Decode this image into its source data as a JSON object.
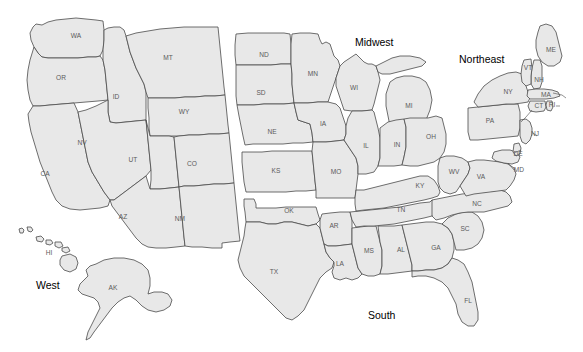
{
  "map": {
    "title": "United States Census Regions Map",
    "background_color": "#ffffff",
    "state_fill_color": "#e8e8e8",
    "state_border_color": "#4a4a4a",
    "state_label_color": "#5a5a5a",
    "region_label_color": "#000000"
  },
  "regions": [
    {
      "name": "West",
      "label": "West",
      "x": 36,
      "y": 280
    },
    {
      "name": "Midwest",
      "label": "Midwest",
      "x": 355,
      "y": 37
    },
    {
      "name": "South",
      "label": "South",
      "x": 368,
      "y": 310
    },
    {
      "name": "Northeast",
      "label": "Northeast",
      "x": 459,
      "y": 54
    }
  ],
  "states": [
    {
      "abbr": "WA",
      "name": "Washington",
      "region": "West",
      "lx": 76,
      "ly": 38
    },
    {
      "abbr": "OR",
      "name": "Oregon",
      "region": "West",
      "lx": 61,
      "ly": 80
    },
    {
      "abbr": "ID",
      "name": "Idaho",
      "region": "West",
      "lx": 116,
      "ly": 99
    },
    {
      "abbr": "MT",
      "name": "Montana",
      "region": "West",
      "lx": 168,
      "ly": 60
    },
    {
      "abbr": "WY",
      "name": "Wyoming",
      "region": "West",
      "lx": 184,
      "ly": 114
    },
    {
      "abbr": "NV",
      "name": "Nevada",
      "region": "West",
      "lx": 82,
      "ly": 145
    },
    {
      "abbr": "UT",
      "name": "Utah",
      "region": "West",
      "lx": 133,
      "ly": 162
    },
    {
      "abbr": "CO",
      "name": "Colorado",
      "region": "West",
      "lx": 192,
      "ly": 166
    },
    {
      "abbr": "CA",
      "name": "California",
      "region": "West",
      "lx": 45,
      "ly": 176
    },
    {
      "abbr": "AZ",
      "name": "Arizona",
      "region": "West",
      "lx": 123,
      "ly": 219
    },
    {
      "abbr": "NM",
      "name": "New Mexico",
      "region": "West",
      "lx": 180,
      "ly": 221
    },
    {
      "abbr": "AK",
      "name": "Alaska",
      "region": "West",
      "lx": 113,
      "ly": 290
    },
    {
      "abbr": "HI",
      "name": "Hawaii",
      "region": "West",
      "lx": 49,
      "ly": 255
    },
    {
      "abbr": "ND",
      "name": "North Dakota",
      "region": "Midwest",
      "lx": 264,
      "ly": 57
    },
    {
      "abbr": "SD",
      "name": "South Dakota",
      "region": "Midwest",
      "lx": 261,
      "ly": 95
    },
    {
      "abbr": "NE",
      "name": "Nebraska",
      "region": "Midwest",
      "lx": 272,
      "ly": 134
    },
    {
      "abbr": "KS",
      "name": "Kansas",
      "region": "Midwest",
      "lx": 276,
      "ly": 173
    },
    {
      "abbr": "MN",
      "name": "Minnesota",
      "region": "Midwest",
      "lx": 313,
      "ly": 76
    },
    {
      "abbr": "IA",
      "name": "Iowa",
      "region": "Midwest",
      "lx": 323,
      "ly": 126
    },
    {
      "abbr": "MO",
      "name": "Missouri",
      "region": "Midwest",
      "lx": 336,
      "ly": 174
    },
    {
      "abbr": "WI",
      "name": "Wisconsin",
      "region": "Midwest",
      "lx": 354,
      "ly": 90
    },
    {
      "abbr": "IL",
      "name": "Illinois",
      "region": "Midwest",
      "lx": 366,
      "ly": 148
    },
    {
      "abbr": "MI",
      "name": "Michigan",
      "region": "Midwest",
      "lx": 409,
      "ly": 108
    },
    {
      "abbr": "IN",
      "name": "Indiana",
      "region": "Midwest",
      "lx": 397,
      "ly": 147
    },
    {
      "abbr": "OH",
      "name": "Ohio",
      "region": "Midwest",
      "lx": 431,
      "ly": 139
    },
    {
      "abbr": "OK",
      "name": "Oklahoma",
      "region": "South",
      "lx": 289,
      "ly": 213
    },
    {
      "abbr": "TX",
      "name": "Texas",
      "region": "South",
      "lx": 274,
      "ly": 274
    },
    {
      "abbr": "AR",
      "name": "Arkansas",
      "region": "South",
      "lx": 334,
      "ly": 228
    },
    {
      "abbr": "LA",
      "name": "Louisiana",
      "region": "South",
      "lx": 340,
      "ly": 266
    },
    {
      "abbr": "MS",
      "name": "Mississippi",
      "region": "South",
      "lx": 369,
      "ly": 253
    },
    {
      "abbr": "AL",
      "name": "Alabama",
      "region": "South",
      "lx": 401,
      "ly": 252
    },
    {
      "abbr": "GA",
      "name": "Georgia",
      "region": "South",
      "lx": 436,
      "ly": 250
    },
    {
      "abbr": "FL",
      "name": "Florida",
      "region": "South",
      "lx": 468,
      "ly": 303
    },
    {
      "abbr": "SC",
      "name": "South Carolina",
      "region": "South",
      "lx": 465,
      "ly": 231
    },
    {
      "abbr": "NC",
      "name": "North Carolina",
      "region": "South",
      "lx": 477,
      "ly": 206
    },
    {
      "abbr": "TN",
      "name": "Tennessee",
      "region": "South",
      "lx": 401,
      "ly": 212
    },
    {
      "abbr": "KY",
      "name": "Kentucky",
      "region": "South",
      "lx": 420,
      "ly": 188
    },
    {
      "abbr": "WV",
      "name": "West Virginia",
      "region": "South",
      "lx": 454,
      "ly": 174
    },
    {
      "abbr": "VA",
      "name": "Virginia",
      "region": "South",
      "lx": 481,
      "ly": 179
    },
    {
      "abbr": "MD",
      "name": "Maryland",
      "region": "South",
      "lx": 519,
      "ly": 172
    },
    {
      "abbr": "DE",
      "name": "Delaware",
      "region": "South",
      "lx": 518,
      "ly": 156
    },
    {
      "abbr": "PA",
      "name": "Pennsylvania",
      "region": "Northeast",
      "lx": 490,
      "ly": 123
    },
    {
      "abbr": "NY",
      "name": "New York",
      "region": "Northeast",
      "lx": 508,
      "ly": 94
    },
    {
      "abbr": "NJ",
      "name": "New Jersey",
      "region": "Northeast",
      "lx": 535,
      "ly": 136
    },
    {
      "abbr": "ME",
      "name": "Maine",
      "region": "Northeast",
      "lx": 551,
      "ly": 52
    },
    {
      "abbr": "VT",
      "name": "Vermont",
      "region": "Northeast",
      "lx": 528,
      "ly": 70
    },
    {
      "abbr": "NH",
      "name": "New Hampshire",
      "region": "Northeast",
      "lx": 539,
      "ly": 82
    },
    {
      "abbr": "MA",
      "name": "Massachusetts",
      "region": "Northeast",
      "lx": 546,
      "ly": 97
    },
    {
      "abbr": "CT",
      "name": "Connecticut",
      "region": "Northeast",
      "lx": 539,
      "ly": 108
    },
    {
      "abbr": "RI",
      "name": "Rhode Island",
      "region": "Northeast",
      "lx": 552,
      "ly": 107
    }
  ]
}
